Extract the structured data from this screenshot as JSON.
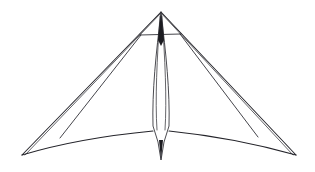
{
  "figure": {
    "title": "Delta kite frame line drawing",
    "background_color": "#ffffff",
    "line_color": "#24242a",
    "canvas": {
      "width": 315,
      "height": 172
    }
  },
  "geometry": {
    "apex": {
      "x": 161,
      "y": 12,
      "label": "nose apex"
    },
    "left_tip": {
      "x": 22,
      "y": 155,
      "label": "left wing tip"
    },
    "right_tip": {
      "x": 296,
      "y": 155,
      "label": "right wing tip"
    },
    "keel_bottom": {
      "x": 161,
      "y": 160,
      "label": "keel tail point"
    },
    "crossbar": {
      "left": {
        "x": 140,
        "y": 35
      },
      "right": {
        "x": 181,
        "y": 34
      },
      "label": "cross spar"
    },
    "strut_join_left": {
      "x": 60,
      "y": 138,
      "label": "left strut junction"
    },
    "strut_join_right": {
      "x": 258,
      "y": 137,
      "label": "right strut junction"
    },
    "trailing_edge_center": {
      "x": 161,
      "y": 131,
      "label": "trailing edge root"
    },
    "keel_shoulder_left": {
      "x": 153,
      "y": 130
    },
    "keel_shoulder_right": {
      "x": 169,
      "y": 130
    },
    "keel_widest_y": 120
  },
  "paths": {
    "leading_edge_left_outer": "M 161 12 L 22 155",
    "leading_edge_left_inner": "M 161 13 L 25 155",
    "leading_edge_right_outer": "M 161 12 L 296 155",
    "leading_edge_right_inner": "M 161 13 L 293 155",
    "trailing_edge_left": "M 22 155 C 52 146 100 136 153 131",
    "trailing_edge_right": "M 296 155 C 264 146 218 136 169 131",
    "strut_left": "M 141 35 L 60 138",
    "strut_right": "M 180 34 L 258 137",
    "crossbar": "M 140 35 L 181 34",
    "keel_outline": "M 161 14 C 156 52 152 92 153 126 L 158 142 L 161 160 L 164 142 L 169 126 C 170 92 166 52 161 14 Z",
    "keel_center_left": "M 160 16 C 157 58 155 100 157 130",
    "keel_center_right": "M 162 16 C 165 58 167 100 165 130",
    "nose_wedge": "M 161 12 L 158 40 L 161 46 L 164 40 Z"
  },
  "elements": [
    {
      "id": "leading-edge-left",
      "name": "Left leading edge spar"
    },
    {
      "id": "leading-edge-right",
      "name": "Right leading edge spar"
    },
    {
      "id": "trailing-edge",
      "name": "Curved trailing edge"
    },
    {
      "id": "cross-spar",
      "name": "Horizontal cross spar"
    },
    {
      "id": "strut-left",
      "name": "Left diagonal strut"
    },
    {
      "id": "strut-right",
      "name": "Right diagonal strut"
    },
    {
      "id": "keel",
      "name": "Central keel spindle"
    },
    {
      "id": "nose",
      "name": "Nose fitting"
    }
  ]
}
